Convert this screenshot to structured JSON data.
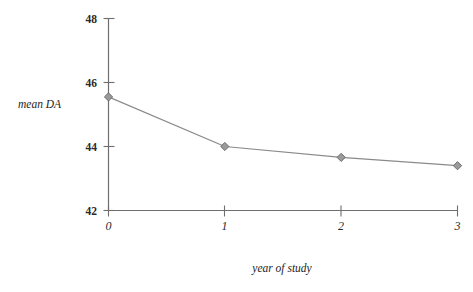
{
  "chart_data": {
    "type": "line",
    "title": "",
    "subtitle": "",
    "xlabel": "year of study",
    "ylabel": "mean DA",
    "x": [
      0,
      1,
      2,
      3
    ],
    "values": [
      45.55,
      44.0,
      43.66,
      43.4
    ],
    "categories": [
      "0",
      "1",
      "2",
      "3"
    ],
    "series": [
      {
        "name": "mean DA",
        "values": [
          45.55,
          44.0,
          43.66,
          43.4
        ]
      }
    ],
    "xlim": [
      0,
      3
    ],
    "ylim": [
      42,
      48
    ],
    "x_ticks": [
      0,
      1,
      2,
      3
    ],
    "x_tick_labels": [
      "0",
      "1",
      "2",
      "3"
    ],
    "y_ticks": [
      42,
      44,
      46,
      48
    ],
    "y_tick_labels": [
      "42",
      "44",
      "46",
      "48"
    ],
    "grid": false,
    "legend": false,
    "legend_position": "none",
    "marker": "diamond",
    "line_color": "#8a8a8a",
    "marker_fill": "#9a9a9a",
    "marker_stroke": "#6e6e6e",
    "axis_color": "#6e6e6e",
    "text_color": "#2b2b2b",
    "background": "#ffffff"
  },
  "axis": {
    "y_label": "mean DA",
    "x_label": "year of study"
  },
  "y_ticks": [
    {
      "label": "48"
    },
    {
      "label": "46"
    },
    {
      "label": "44"
    },
    {
      "label": "42"
    }
  ],
  "x_ticks": [
    {
      "label": "0"
    },
    {
      "label": "1"
    },
    {
      "label": "2"
    },
    {
      "label": "3"
    }
  ]
}
